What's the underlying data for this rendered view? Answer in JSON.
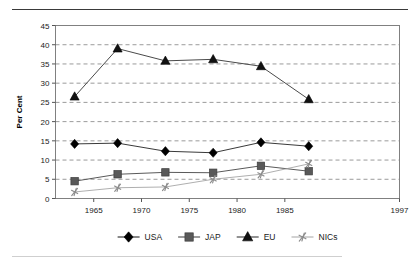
{
  "figure": {
    "rule_top": "horizontal-rule",
    "rule_bottom": "horizontal-rule"
  },
  "chart_data": {
    "type": "line",
    "title": "",
    "subtitle": "",
    "xlabel": "",
    "ylabel": "Per Cent",
    "x": [
      1963,
      1967.5,
      1972.5,
      1977.5,
      1982.5,
      1987.5
    ],
    "xlim": [
      1961,
      1997
    ],
    "ylim": [
      0,
      45
    ],
    "xticks": [
      1965,
      1970,
      1975,
      1980,
      1985,
      1997
    ],
    "xtick_labels": [
      "1965",
      "1970",
      "1975",
      "1980",
      "1985",
      "1997"
    ],
    "yticks": [
      0,
      5,
      10,
      15,
      20,
      25,
      30,
      35,
      40,
      45
    ],
    "ytick_labels": [
      "0",
      "5",
      "10",
      "15",
      "20",
      "25",
      "30",
      "35",
      "40",
      "45"
    ],
    "grid": "horizontal-dashed",
    "legend_position": "bottom",
    "series": [
      {
        "name": "USA",
        "marker": "diamond",
        "color": "#000000",
        "line_color": "#3a3a3a",
        "values": [
          14.2,
          14.4,
          12.3,
          11.9,
          14.6,
          13.6
        ]
      },
      {
        "name": "JAP",
        "marker": "square",
        "color": "#595959",
        "line_color": "#5a5a5a",
        "values": [
          4.5,
          6.3,
          6.8,
          6.7,
          8.5,
          7.1
        ]
      },
      {
        "name": "EU",
        "marker": "triangle",
        "color": "#111111",
        "line_color": "#4a4a4a",
        "values": [
          26.5,
          39.0,
          35.8,
          36.2,
          34.4,
          25.8
        ]
      },
      {
        "name": "NICs",
        "marker": "star-x",
        "color": "#8c8c8c",
        "line_color": "#9a9a9a",
        "values": [
          1.7,
          2.8,
          3.0,
          5.0,
          6.3,
          9.0
        ]
      }
    ]
  },
  "legend": {
    "items": [
      {
        "label": "USA",
        "marker": "diamond"
      },
      {
        "label": "JAP",
        "marker": "square"
      },
      {
        "label": "EU",
        "marker": "triangle"
      },
      {
        "label": "NICs",
        "marker": "star-x"
      }
    ]
  }
}
